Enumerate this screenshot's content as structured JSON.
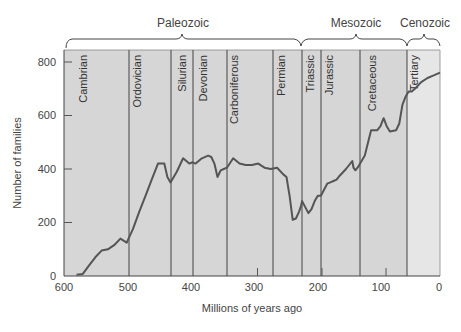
{
  "chart_data": {
    "type": "line",
    "title": "",
    "xlabel": "Millions of years ago",
    "ylabel": "Number of families",
    "xlim": [
      600,
      0
    ],
    "ylim": [
      0,
      800
    ],
    "x_ticks": [
      "600",
      "500",
      "400",
      "300",
      "200",
      "100",
      "0"
    ],
    "y_ticks": [
      "0",
      "200",
      "400",
      "600",
      "800"
    ],
    "grid": false,
    "legend": null,
    "eras": [
      {
        "name": "Paleozoic",
        "start": 542,
        "end": 251
      },
      {
        "name": "Mesozoic",
        "start": 251,
        "end": 65
      },
      {
        "name": "Cenozoic",
        "start": 65,
        "end": 0
      }
    ],
    "periods": [
      {
        "name": "Cambrian",
        "start": 600,
        "end": 497
      },
      {
        "name": "Ordovician",
        "start": 497,
        "end": 430
      },
      {
        "name": "Silurian",
        "start": 430,
        "end": 395
      },
      {
        "name": "Devonian",
        "start": 395,
        "end": 342
      },
      {
        "name": "Carboniferous",
        "start": 342,
        "end": 268
      },
      {
        "name": "Permian",
        "start": 268,
        "end": 222
      },
      {
        "name": "Triassic",
        "start": 222,
        "end": 192
      },
      {
        "name": "Jurassic",
        "start": 192,
        "end": 129
      },
      {
        "name": "Cretaceous",
        "start": 129,
        "end": 56
      },
      {
        "name": "Tertiary",
        "start": 56,
        "end": 0
      }
    ],
    "series": [
      {
        "name": "Marine families",
        "x": [
          580,
          570,
          560,
          550,
          540,
          530,
          520,
          510,
          500,
          490,
          480,
          470,
          460,
          450,
          440,
          435,
          430,
          425,
          420,
          410,
          400,
          395,
          390,
          380,
          370,
          365,
          360,
          355,
          350,
          345,
          340,
          330,
          320,
          310,
          300,
          290,
          280,
          270,
          260,
          250,
          245,
          240,
          235,
          230,
          225,
          222,
          220,
          210,
          205,
          200,
          195,
          190,
          180,
          175,
          170,
          165,
          160,
          150,
          140,
          138,
          135,
          130,
          120,
          110,
          100,
          95,
          90,
          85,
          80,
          70,
          65,
          60,
          55,
          50,
          45,
          40,
          30,
          20,
          10,
          0
        ],
        "values": [
          5,
          8,
          40,
          70,
          95,
          100,
          115,
          140,
          125,
          175,
          240,
          300,
          360,
          420,
          420,
          370,
          350,
          370,
          390,
          440,
          420,
          425,
          420,
          440,
          450,
          445,
          420,
          370,
          395,
          400,
          405,
          440,
          420,
          415,
          415,
          420,
          405,
          400,
          405,
          380,
          370,
          300,
          210,
          215,
          240,
          260,
          280,
          235,
          250,
          280,
          300,
          300,
          345,
          350,
          355,
          360,
          375,
          400,
          430,
          405,
          395,
          410,
          450,
          545,
          545,
          560,
          590,
          560,
          540,
          545,
          570,
          640,
          670,
          690,
          690,
          700,
          725,
          740,
          750,
          760
        ]
      }
    ]
  },
  "labels": {
    "eras": [
      "Paleozoic",
      "Mesozoic",
      "Cenozoic"
    ],
    "periods": [
      "Cambrian",
      "Ordovician",
      "Silurian",
      "Devonian",
      "Carboniferous",
      "Permian",
      "Triassic",
      "Jurassic",
      "Cretaceous",
      "Tertiary"
    ],
    "xlabel": "Millions of years ago",
    "ylabel": "Number of families",
    "x_ticks": [
      "600",
      "500",
      "400",
      "300",
      "200",
      "100",
      "0"
    ],
    "y_ticks": [
      "0",
      "200",
      "400",
      "600",
      "800"
    ]
  },
  "colors": {
    "plot_bg": "#d6d6d6",
    "tertiary_bg": "#e6e6e6",
    "line": "#555555",
    "boundaries": "#333333"
  }
}
